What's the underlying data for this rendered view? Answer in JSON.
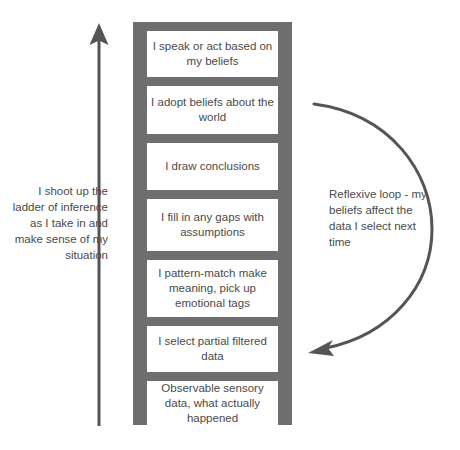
{
  "diagram": {
    "title": "Ladder of Inference",
    "colors": {
      "ladder": "#6e6e6e",
      "text": "#4a4a4a",
      "arrow": "#555555",
      "background": "#ffffff"
    },
    "ladder": {
      "steps": [
        {
          "id": "step-speak-act",
          "text": "I speak or act based on my beliefs"
        },
        {
          "id": "step-adopt-beliefs",
          "text": "I adopt beliefs about the world"
        },
        {
          "id": "step-draw-conclusions",
          "text": "I draw conclusions"
        },
        {
          "id": "step-fill-gaps",
          "text": "I fill in any gaps with assumptions"
        },
        {
          "id": "step-pattern-match",
          "text": "I pattern-match make meaning, pick up emotional tags"
        },
        {
          "id": "step-select-data",
          "text": "I select partial filtered data"
        },
        {
          "id": "step-observable-data",
          "text": "Observable sensory data, what actually happened"
        }
      ]
    },
    "captions": {
      "left": "I shoot up the ladder of inference as I take in and make sense of my situation",
      "right": "Reflexive loop - my beliefs affect the data I select next time"
    },
    "arrows": {
      "up_arrow_name": "up-arrow-icon",
      "loop_arrow_name": "reflexive-loop-arrow-icon"
    }
  }
}
